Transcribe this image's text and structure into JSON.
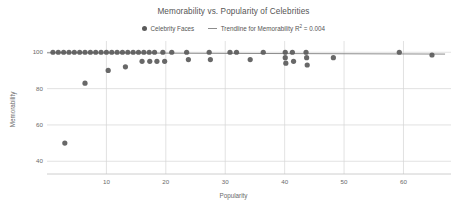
{
  "chart_data": {
    "type": "scatter",
    "title": "Memorability vs. Popularity of Celebrities",
    "xlabel": "Popularity",
    "ylabel": "Memorability",
    "xlim": [
      0,
      68
    ],
    "ylim": [
      33,
      104
    ],
    "xticks": [
      10,
      20,
      30,
      40,
      50,
      60
    ],
    "yticks": [
      40,
      60,
      80,
      100
    ],
    "grid": true,
    "legend_position": "top-center",
    "legend": [
      {
        "label": "Celebrity Faces",
        "marker": "dot",
        "color": "#5b5b5b"
      },
      {
        "label": "Trendline for Memorability R² = 0.004",
        "marker": "line",
        "color": "#8d8d8d"
      }
    ],
    "series": [
      {
        "name": "Celebrity Faces",
        "marker": "dot",
        "color": "#5b5b5b",
        "points": [
          [
            1.0,
            100
          ],
          [
            1.9,
            100
          ],
          [
            2.8,
            100
          ],
          [
            3.7,
            100
          ],
          [
            4.6,
            100
          ],
          [
            5.5,
            100
          ],
          [
            6.4,
            100
          ],
          [
            7.3,
            100
          ],
          [
            8.2,
            100
          ],
          [
            9.1,
            100
          ],
          [
            10.0,
            100
          ],
          [
            10.9,
            100
          ],
          [
            11.8,
            100
          ],
          [
            12.7,
            100
          ],
          [
            13.6,
            100
          ],
          [
            14.5,
            100
          ],
          [
            15.4,
            100
          ],
          [
            16.3,
            100
          ],
          [
            17.2,
            100
          ],
          [
            18.1,
            100
          ],
          [
            19.5,
            100
          ],
          [
            21.0,
            100
          ],
          [
            3.0,
            50
          ],
          [
            6.4,
            83
          ],
          [
            10.3,
            90
          ],
          [
            13.2,
            92
          ],
          [
            16.0,
            95
          ],
          [
            17.3,
            95
          ],
          [
            18.5,
            95
          ],
          [
            19.8,
            95
          ],
          [
            23.5,
            100
          ],
          [
            23.8,
            96
          ],
          [
            27.3,
            100
          ],
          [
            27.5,
            96
          ],
          [
            30.8,
            100
          ],
          [
            31.9,
            100
          ],
          [
            34.2,
            96
          ],
          [
            36.4,
            100
          ],
          [
            40.1,
            100
          ],
          [
            40.1,
            97
          ],
          [
            40.2,
            94
          ],
          [
            41.3,
            100
          ],
          [
            41.5,
            95
          ],
          [
            43.6,
            100
          ],
          [
            43.7,
            97
          ],
          [
            43.8,
            93
          ],
          [
            48.2,
            97
          ],
          [
            59.3,
            100
          ],
          [
            64.8,
            98.5
          ]
        ]
      }
    ],
    "trendline": {
      "name": "Trendline for Memorability",
      "color": "#8d8d8d",
      "r_squared": 0.004,
      "x_start": 0.0,
      "y_start": 99.7,
      "x_end": 67.0,
      "y_end": 99.0
    }
  }
}
